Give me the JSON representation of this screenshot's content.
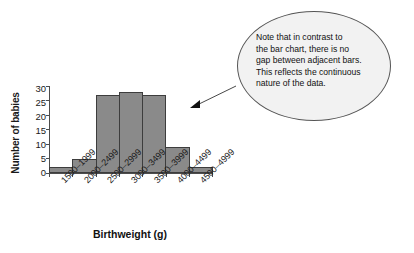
{
  "chart_data": {
    "type": "bar",
    "title": "",
    "xlabel": "Birthweight (g)",
    "ylabel": "Number of babies",
    "categories": [
      "1500–1999",
      "2000–2499",
      "2500–2999",
      "3000–3499",
      "3500–3999",
      "4000–4499",
      "4500–4999"
    ],
    "values": [
      2,
      5,
      27,
      28,
      27,
      9,
      2
    ],
    "ylim": [
      0,
      30
    ],
    "yticks": [
      0,
      5,
      10,
      15,
      20,
      25,
      30
    ],
    "ytick_labels": [
      "0",
      "5",
      "10",
      "15",
      "20",
      "25",
      "30"
    ],
    "grid": false,
    "legend": null,
    "bar_gap": 0,
    "bar_color": "#8a8a8a",
    "bar_edge_color": "#3d3d3d",
    "axis_color": "#4d4d4d"
  },
  "annotation": {
    "text": "Note that in contrast to the bar chart, there is no gap between adjacent bars. This reflects the continuous nature of the data.",
    "lines": [
      "Note that in contrast to",
      "the bar chart, there is no",
      "gap between adjacent bars.",
      "This reflects the continuous",
      "nature of the data."
    ],
    "shape": "ellipse",
    "fill_color": "#f2f2f2",
    "border_color": "#555555",
    "pointer": "arrow"
  }
}
